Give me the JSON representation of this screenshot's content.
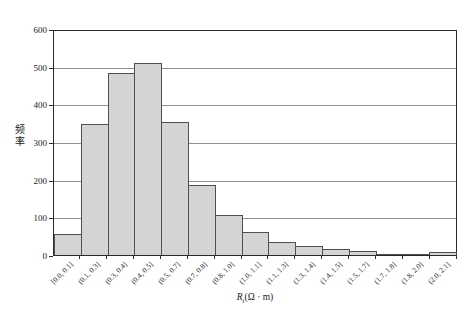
{
  "chart_data": {
    "type": "bar",
    "subtype": "histogram",
    "title": "",
    "ylabel": "频率",
    "xlabel": {
      "symbol": "R",
      "subscript": "t",
      "unit": "(Ω · m)"
    },
    "categories": [
      "[0.0, 0.1]",
      "(0.1, 0.3]",
      "(0.3, 0.4]",
      "(0.4, 0.5]",
      "(0.5, 0.7]",
      "(0.7, 0.8]",
      "(0.8, 1.0]",
      "(1.0, 1.1]",
      "(1.1, 1.3]",
      "(1.3, 1.4]",
      "(1.4, 1.5]",
      "(1.5, 1.7]",
      "(1.7, 1.8]",
      "(1.8, 2.0]",
      "(2.0, 2.1]"
    ],
    "values": [
      55,
      350,
      488,
      515,
      355,
      188,
      106,
      62,
      35,
      23,
      16,
      10,
      2,
      2,
      8
    ],
    "ylim": [
      0,
      600
    ],
    "yticks": [
      0,
      100,
      200,
      300,
      400,
      500,
      600
    ],
    "grid": "horizontal",
    "legend": "none",
    "colors": {
      "bar_fill": "#d4d4d4",
      "bar_border": "#4f4f4f",
      "gridline": "#8f8f8f",
      "axis_frame": "#2b2b2b",
      "background": "#ffffff",
      "text": "#1a1a1a"
    }
  }
}
